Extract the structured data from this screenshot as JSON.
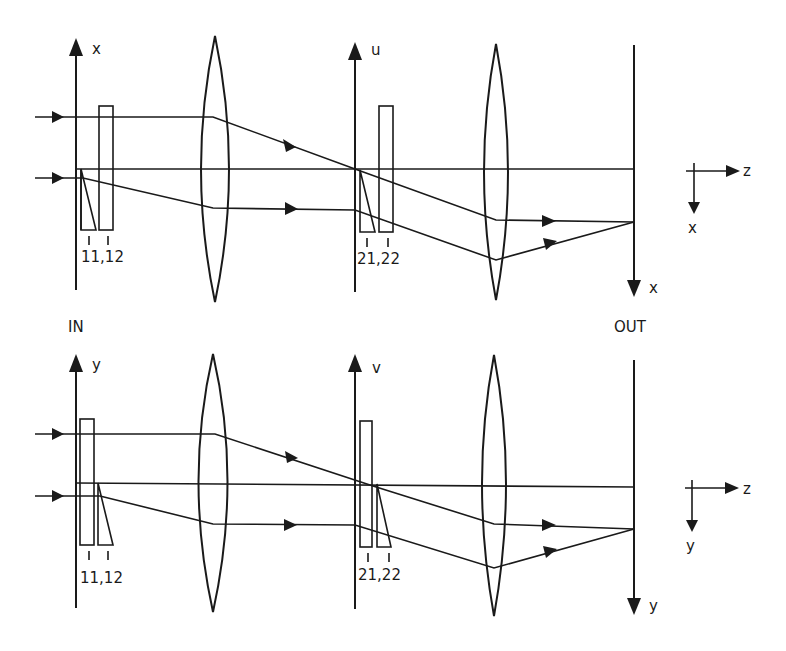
{
  "figure": {
    "type": "optical-system-schematic",
    "panels": [
      {
        "id": "top",
        "plane": "x-z",
        "input_axis_label": "x",
        "intermediate_axis_label": "u",
        "output_axis_label": "x",
        "element_labels_first": "11,12",
        "element_labels_second": "21,22",
        "coord_frame": {
          "horizontal": "z",
          "vertical": "x"
        }
      },
      {
        "id": "bottom",
        "plane": "y-z",
        "input_axis_label": "y",
        "intermediate_axis_label": "v",
        "output_axis_label": "y",
        "element_labels_first": "11,12",
        "element_labels_second": "21,22",
        "coord_frame": {
          "horizontal": "z",
          "vertical": "y"
        }
      }
    ],
    "in_label": "IN",
    "out_label": "OUT"
  }
}
